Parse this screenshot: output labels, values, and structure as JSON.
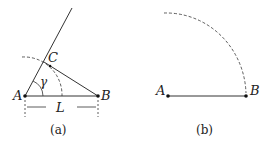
{
  "figure_a": {
    "caption": "(a)",
    "labels": {
      "A": "A",
      "B": "B",
      "C": "C",
      "gamma": "γ",
      "L": "L"
    }
  },
  "figure_b": {
    "caption": "(b)",
    "labels": {
      "A": "A",
      "B": "B"
    }
  },
  "colors": {
    "stroke": "#333333",
    "point": "#111111"
  }
}
